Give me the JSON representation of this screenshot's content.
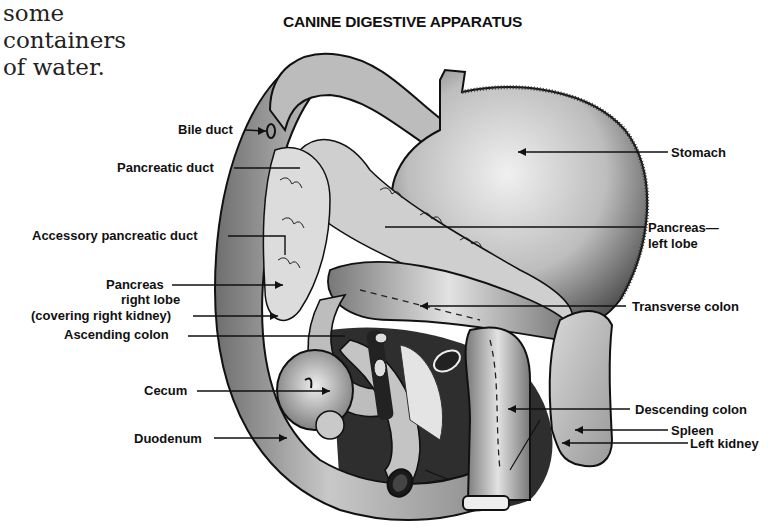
{
  "body_text": {
    "lines": [
      "some",
      "containers",
      "of  water."
    ]
  },
  "figure": {
    "title": "CANINE DIGESTIVE APPARATUS",
    "labels_left": [
      {
        "id": "bile-duct",
        "text": "Bile duct"
      },
      {
        "id": "pancreatic-duct",
        "text": "Pancreatic duct"
      },
      {
        "id": "accessory-pancreatic-duct",
        "text": "Accessory pancreatic duct"
      },
      {
        "id": "pancreas-right-lobe",
        "lines": [
          "Pancreas",
          "right lobe",
          "(covering right kidney)"
        ]
      },
      {
        "id": "ascending-colon",
        "text": "Ascending colon"
      },
      {
        "id": "cecum",
        "text": "Cecum"
      },
      {
        "id": "duodenum",
        "text": "Duodenum"
      }
    ],
    "labels_right": [
      {
        "id": "stomach",
        "text": "Stomach"
      },
      {
        "id": "pancreas-left-lobe",
        "lines": [
          "Pancreas—",
          "left lobe"
        ]
      },
      {
        "id": "transverse-colon",
        "text": "Transverse colon"
      },
      {
        "id": "descending-colon",
        "text": "Descending colon"
      },
      {
        "id": "spleen",
        "text": "Spleen"
      },
      {
        "id": "left-kidney",
        "text": "Left kidney"
      }
    ],
    "colors": {
      "ink": "#111111",
      "organ_light": "#d9d9d9",
      "organ_mid": "#a8a8a8",
      "organ_dark": "#4a4a4a",
      "paper": "#ffffff"
    }
  }
}
